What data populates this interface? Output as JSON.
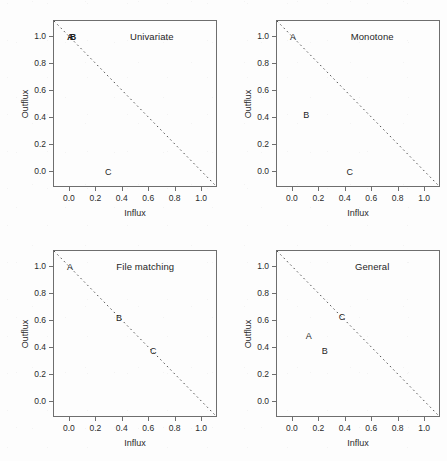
{
  "figure": {
    "width": 447,
    "height": 461,
    "background": "#fdfdfd",
    "line_color": "#4a4a4a",
    "frame_color": "#6e6e6e",
    "text_color": "#1f1f1f"
  },
  "axes": {
    "xlabel": "Influx",
    "ylabel": "Outflux",
    "xticks": [
      "0.0",
      "0.2",
      "0.4",
      "0.6",
      "0.8",
      "1.0"
    ],
    "yticks": [
      "0.0",
      "0.2",
      "0.4",
      "0.6",
      "0.8",
      "1.0"
    ],
    "xtick_values": [
      0.0,
      0.2,
      0.4,
      0.6,
      0.8,
      1.0
    ],
    "ytick_values": [
      0.0,
      0.2,
      0.4,
      0.6,
      0.8,
      1.0
    ],
    "xlim": [
      -0.12,
      1.12
    ],
    "ylim": [
      -0.12,
      1.12
    ],
    "grid": false
  },
  "chart_data": {
    "type": "scatter",
    "title": "",
    "xlabel": "Influx",
    "ylabel": "Outflux",
    "xlim": [
      -0.12,
      1.12
    ],
    "ylim": [
      -0.12,
      1.12
    ],
    "grid": false,
    "legend": "none",
    "reference_line": {
      "label": "influx + outflux = 1",
      "style": "dashed",
      "x": [
        -0.12,
        1.12
      ],
      "y": [
        1.12,
        -0.12
      ]
    },
    "panels": [
      {
        "id": "p0",
        "title": "Univariate",
        "title_x": 0.62,
        "points": [
          {
            "label": "A",
            "x": 0.0,
            "y": 1.0
          },
          {
            "label": "B",
            "x": 0.0,
            "y": 1.0
          },
          {
            "label": "C",
            "x": 0.29,
            "y": 0.0
          }
        ],
        "stacked_labels": [
          {
            "label": "AB",
            "x": 0.0,
            "y": 1.0,
            "overlapping": true
          }
        ]
      },
      {
        "id": "p1",
        "title": "Monotone",
        "title_x": 0.6,
        "points": [
          {
            "label": "A",
            "x": 0.0,
            "y": 1.0
          },
          {
            "label": "B",
            "x": 0.1,
            "y": 0.42
          },
          {
            "label": "C",
            "x": 0.43,
            "y": 0.0
          }
        ],
        "stacked_labels": []
      },
      {
        "id": "p2",
        "title": "File matching",
        "title_x": 0.57,
        "points": [
          {
            "label": "A",
            "x": 0.0,
            "y": 1.0
          },
          {
            "label": "B",
            "x": 0.37,
            "y": 0.62
          },
          {
            "label": "C",
            "x": 0.63,
            "y": 0.38
          }
        ],
        "stacked_labels": []
      },
      {
        "id": "p3",
        "title": "General",
        "title_x": 0.6,
        "points": [
          {
            "label": "A",
            "x": 0.12,
            "y": 0.49
          },
          {
            "label": "B",
            "x": 0.24,
            "y": 0.38
          },
          {
            "label": "C",
            "x": 0.37,
            "y": 0.63
          }
        ],
        "stacked_labels": []
      }
    ]
  }
}
